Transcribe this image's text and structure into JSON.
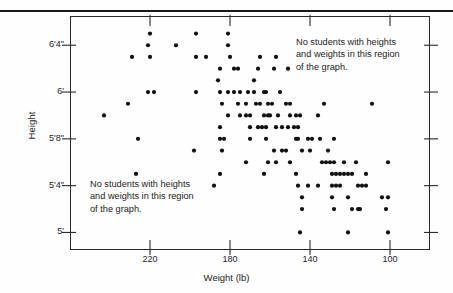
{
  "chart_data": {
    "type": "scatter",
    "title": "",
    "xlabel": "Weight (lb)",
    "ylabel": "Height",
    "x_reversed": true,
    "xlim": [
      260,
      80
    ],
    "ylim_inches": [
      58.5,
      78.5
    ],
    "grid": false,
    "legend": null,
    "xticks": [
      {
        "value": 220,
        "label": "220"
      },
      {
        "value": 180,
        "label": "180"
      },
      {
        "value": 140,
        "label": "140"
      },
      {
        "value": 100,
        "label": "100"
      }
    ],
    "yticks": [
      {
        "inches": 76,
        "label": "6'4\""
      },
      {
        "inches": 72,
        "label": "6'"
      },
      {
        "inches": 68,
        "label": "5'8\""
      },
      {
        "inches": 64,
        "label": "5'4\""
      },
      {
        "inches": 60,
        "label": "5'"
      }
    ],
    "annotations": [
      {
        "name": "upper-right-region-note",
        "text": "No students with heights\nand weights  in this region\nof the graph.",
        "position": "upper-right"
      },
      {
        "name": "lower-left-region-note",
        "text": "No students with heights\nand weights  in this region\nof the graph.",
        "position": "lower-left"
      }
    ],
    "point_color": "#111111",
    "point_radius_px": 2.1,
    "points": [
      [
        207,
        76
      ],
      [
        220,
        77
      ],
      [
        221,
        76
      ],
      [
        197,
        77
      ],
      [
        181,
        77
      ],
      [
        181,
        76
      ],
      [
        229,
        75
      ],
      [
        220,
        75
      ],
      [
        197,
        75
      ],
      [
        192,
        75
      ],
      [
        180,
        75
      ],
      [
        165,
        75
      ],
      [
        157,
        75
      ],
      [
        185,
        74
      ],
      [
        178,
        74
      ],
      [
        176,
        74
      ],
      [
        166,
        74
      ],
      [
        158,
        74
      ],
      [
        151,
        74
      ],
      [
        186,
        73
      ],
      [
        168,
        73
      ],
      [
        221,
        72
      ],
      [
        218,
        72
      ],
      [
        197,
        72
      ],
      [
        185,
        72
      ],
      [
        181,
        72
      ],
      [
        178,
        72
      ],
      [
        175,
        72
      ],
      [
        171,
        72
      ],
      [
        168,
        72
      ],
      [
        163,
        72
      ],
      [
        162,
        72
      ],
      [
        155,
        72
      ],
      [
        231,
        71
      ],
      [
        184,
        71
      ],
      [
        176,
        71
      ],
      [
        172,
        71
      ],
      [
        167,
        71
      ],
      [
        165,
        71
      ],
      [
        161,
        71
      ],
      [
        159,
        71
      ],
      [
        152,
        71
      ],
      [
        150,
        71
      ],
      [
        133,
        71
      ],
      [
        109,
        71
      ],
      [
        243,
        70
      ],
      [
        181,
        70
      ],
      [
        175,
        70
      ],
      [
        172,
        70
      ],
      [
        170,
        70
      ],
      [
        163,
        70
      ],
      [
        161,
        70
      ],
      [
        160,
        70
      ],
      [
        156,
        70
      ],
      [
        150,
        70
      ],
      [
        147,
        70
      ],
      [
        145,
        70
      ],
      [
        136,
        70
      ],
      [
        185,
        69
      ],
      [
        170,
        69
      ],
      [
        166,
        69
      ],
      [
        164,
        69
      ],
      [
        162,
        69
      ],
      [
        157,
        69
      ],
      [
        154,
        69
      ],
      [
        151,
        69
      ],
      [
        148,
        69
      ],
      [
        146,
        69
      ],
      [
        226,
        68
      ],
      [
        185,
        68
      ],
      [
        183,
        68
      ],
      [
        170,
        68
      ],
      [
        162,
        68
      ],
      [
        147,
        68
      ],
      [
        146,
        68
      ],
      [
        141,
        68
      ],
      [
        139,
        68
      ],
      [
        135,
        68
      ],
      [
        128,
        68
      ],
      [
        198,
        67
      ],
      [
        184,
        67
      ],
      [
        158,
        67
      ],
      [
        154,
        67
      ],
      [
        152,
        67
      ],
      [
        144,
        67
      ],
      [
        140,
        67
      ],
      [
        131,
        67
      ],
      [
        172,
        66
      ],
      [
        161,
        66
      ],
      [
        157,
        66
      ],
      [
        150,
        66
      ],
      [
        134,
        66
      ],
      [
        132,
        66
      ],
      [
        130,
        66
      ],
      [
        128,
        66
      ],
      [
        123,
        66
      ],
      [
        117,
        66
      ],
      [
        101,
        66
      ],
      [
        227,
        65
      ],
      [
        185,
        65
      ],
      [
        163,
        65
      ],
      [
        147,
        65
      ],
      [
        129,
        65
      ],
      [
        127,
        65
      ],
      [
        125,
        65
      ],
      [
        123,
        65
      ],
      [
        121,
        65
      ],
      [
        119,
        65
      ],
      [
        112,
        65
      ],
      [
        188,
        64
      ],
      [
        146,
        64
      ],
      [
        141,
        64
      ],
      [
        136,
        64
      ],
      [
        129,
        64
      ],
      [
        127,
        64
      ],
      [
        125,
        64
      ],
      [
        116,
        64
      ],
      [
        114,
        64
      ],
      [
        112,
        64
      ],
      [
        144,
        63
      ],
      [
        129,
        63
      ],
      [
        121,
        63
      ],
      [
        104,
        63
      ],
      [
        101,
        63
      ],
      [
        144,
        62
      ],
      [
        128,
        62
      ],
      [
        119,
        62
      ],
      [
        116,
        62
      ],
      [
        115,
        62
      ],
      [
        102,
        62
      ],
      [
        145,
        60
      ],
      [
        121,
        60
      ],
      [
        101,
        60
      ]
    ]
  },
  "axes": {
    "xlabel": "Weight (lb)",
    "ylabel": "Height"
  }
}
